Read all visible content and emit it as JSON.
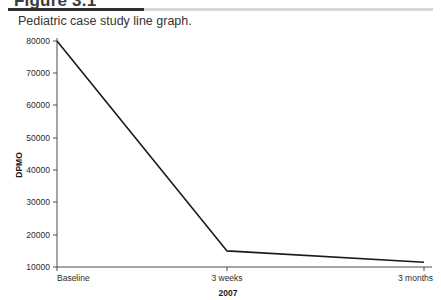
{
  "header": {
    "figure_title": "Figure 3.1",
    "caption": "Pediatric case study line graph.",
    "rule_dark_color": "#2e2e2e",
    "rule_light_color": "#d6d6d6"
  },
  "chart_data": {
    "type": "line",
    "title": "",
    "categories": [
      "Baseline",
      "3 weeks",
      "3 months"
    ],
    "values": [
      80000,
      15000,
      11500
    ],
    "series": [
      {
        "name": "DPMO",
        "values": [
          80000,
          15000,
          11500
        ]
      }
    ],
    "xlabel": "2007",
    "ylabel": "DPMO",
    "ylim": [
      10000,
      80000
    ],
    "yticks": [
      10000,
      20000,
      30000,
      40000,
      50000,
      60000,
      70000,
      80000
    ],
    "ytick_labels": [
      "10000",
      "20000",
      "30000",
      "40000",
      "50000",
      "60000",
      "70000",
      "80000"
    ],
    "xtick_labels": [
      "Baseline",
      "3 weeks",
      "3 months"
    ],
    "grid": false,
    "legend": false,
    "line_color": "#1a1a1a",
    "line_width": 1.6,
    "spines": [
      "left",
      "bottom"
    ]
  },
  "axis": {
    "y_label": "DPMO",
    "x_label": "2007",
    "y_ticks": {
      "t80000": "80000",
      "t70000": "70000",
      "t60000": "60000",
      "t50000": "50000",
      "t40000": "40000",
      "t30000": "30000",
      "t20000": "20000",
      "t10000": "10000"
    },
    "x_ticks": {
      "baseline": "Baseline",
      "weeks3": "3 weeks",
      "months3": "3 months"
    }
  }
}
